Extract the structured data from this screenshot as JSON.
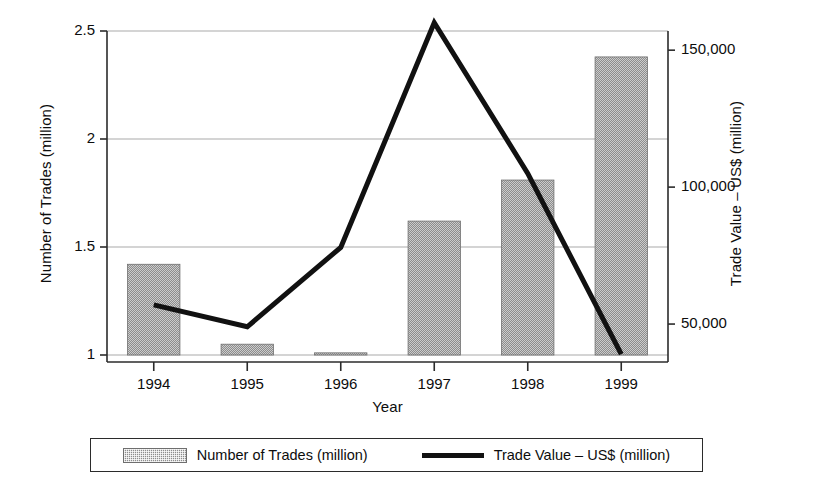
{
  "chart_data": {
    "type": "bar",
    "title": "",
    "subtitle": "",
    "xlabel": "Year",
    "ylabel": "Number of Trades (million)",
    "y2label": "Trade Value – US$ (million)",
    "categories": [
      "1994",
      "1995",
      "1996",
      "1997",
      "1998",
      "1999"
    ],
    "x_tick_labels": [
      "1994",
      "1995",
      "1996",
      "1997",
      "1998",
      "1999"
    ],
    "y_tick_labels": [
      "1",
      "1.5",
      "2",
      "2.5"
    ],
    "y_tick_values": [
      1,
      1.5,
      2,
      2.5
    ],
    "ylim": [
      1,
      2.5
    ],
    "y2_tick_labels": [
      "50,000",
      "100,000",
      "150,000"
    ],
    "y2_tick_values": [
      50000,
      100000,
      150000
    ],
    "y2lim": [
      38700,
      157000
    ],
    "grid": true,
    "grid_axis": "y",
    "legend_position": "bottom",
    "series": [
      {
        "name": "Number of Trades (million)",
        "type": "bar",
        "axis": "left",
        "color": "#8d8d8d",
        "values": [
          1.42,
          1.05,
          1.01,
          1.62,
          1.81,
          2.38
        ]
      },
      {
        "name": "Trade Value – US$ (million)",
        "type": "line",
        "axis": "right",
        "color": "#111111",
        "values": [
          57000,
          49000,
          78000,
          160000,
          105000,
          39000
        ]
      }
    ]
  },
  "legend": {
    "bar_label": "Number of Trades (million)",
    "line_label": "Trade Value – US$ (million)"
  },
  "colors": {
    "bar_fill": "#8d8d8d",
    "line": "#111111",
    "axis": "#2b2b2b",
    "grid": "#a9a9a9",
    "text": "#0d0d0d"
  }
}
